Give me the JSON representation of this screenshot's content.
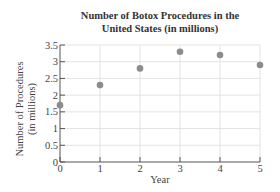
{
  "chart_data": {
    "type": "scatter",
    "title": "Number of Botox Procedures in the United States (in millions)",
    "title_lines": [
      "Number of Botox Procedures in the",
      "United States (in millions)"
    ],
    "xlabel": "Year",
    "ylabel": "Number of Procedures (in millions)",
    "ylabel_lines": [
      "Number of Procedures",
      "(in millions)"
    ],
    "x": [
      0,
      1,
      2,
      3,
      4,
      5
    ],
    "y": [
      1.7,
      2.3,
      2.8,
      3.3,
      3.2,
      2.9
    ],
    "xlim": [
      0,
      5
    ],
    "ylim": [
      0,
      3.5
    ],
    "xticks": [
      "0",
      "1",
      "2",
      "3",
      "4",
      "5"
    ],
    "yticks": [
      "0",
      "0.5",
      "1",
      "1.5",
      "2",
      "2.5",
      "3",
      "3.5"
    ],
    "grid": true,
    "point_color": "#8c8c8c"
  }
}
